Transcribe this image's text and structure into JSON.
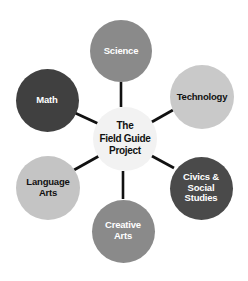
{
  "diagram": {
    "type": "hub-and-spoke",
    "background_color": "#ffffff",
    "connector_color": "#111111",
    "center": {
      "id": "center",
      "label": "The\nField Guide\nProject",
      "text_line_1": "The",
      "text_line_2": "Field Guide",
      "text_line_3": "Project",
      "fill_color": "#f2f2f2",
      "text_color": "#111111",
      "cx": 125,
      "cy": 139,
      "diameter": 64
    },
    "nodes": [
      {
        "id": "science",
        "label": "Science",
        "fill_color": "#8a8a8a",
        "text_color": "#ffffff",
        "cx": 121,
        "cy": 51,
        "diameter": 62
      },
      {
        "id": "technology",
        "label": "Technology",
        "fill_color": "#c9c9c9",
        "text_color": "#111111",
        "cx": 202,
        "cy": 97,
        "diameter": 64
      },
      {
        "id": "civics-social-studies",
        "label": "Civics &\nSocial\nStudies",
        "fill_color": "#4a4a4a",
        "text_color": "#ffffff",
        "cx": 201,
        "cy": 188,
        "diameter": 63
      },
      {
        "id": "creative-arts",
        "label": "Creative\nArts",
        "fill_color": "#8a8a8a",
        "text_color": "#ffffff",
        "cx": 123,
        "cy": 231,
        "diameter": 63
      },
      {
        "id": "language-arts",
        "label": "Language\nArts",
        "fill_color": "#c4c4c4",
        "text_color": "#111111",
        "cx": 48,
        "cy": 188,
        "diameter": 64
      },
      {
        "id": "math",
        "label": "Math",
        "fill_color": "#404040",
        "text_color": "#ffffff",
        "cx": 47,
        "cy": 100,
        "diameter": 63
      }
    ],
    "connectors": [
      {
        "id": "center-to-science",
        "from": "center",
        "to": "science",
        "x1": 121,
        "y1": 107,
        "x2": 121,
        "y2": 82
      },
      {
        "id": "center-to-technology",
        "from": "center",
        "to": "technology",
        "x1": 150,
        "y1": 123,
        "x2": 173,
        "y2": 110
      },
      {
        "id": "center-to-civics",
        "from": "center",
        "to": "civics-social-studies",
        "x1": 150,
        "y1": 155,
        "x2": 174,
        "y2": 168
      },
      {
        "id": "center-to-creative-arts",
        "from": "center",
        "to": "creative-arts",
        "x1": 123,
        "y1": 171,
        "x2": 123,
        "y2": 199
      },
      {
        "id": "center-to-language-arts",
        "from": "center",
        "to": "language-arts",
        "x1": 99,
        "y1": 156,
        "x2": 74,
        "y2": 170
      },
      {
        "id": "center-to-math",
        "from": "center",
        "to": "math",
        "x1": 99,
        "y1": 124,
        "x2": 73,
        "y2": 112
      }
    ]
  }
}
